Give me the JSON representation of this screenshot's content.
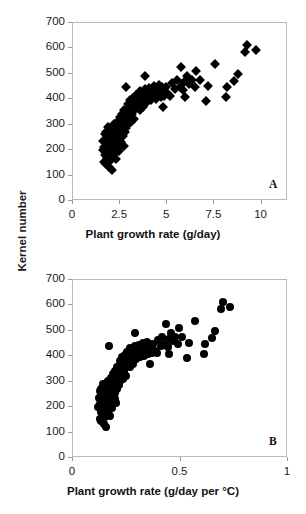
{
  "figure": {
    "ylabel": "Kernel number",
    "panels": [
      {
        "tag": "A",
        "marker": "diamond",
        "xlabel": "Plant growth rate (g/day)"
      },
      {
        "tag": "B",
        "marker": "circle",
        "xlabel": "Plant growth rate (g/day per °C)"
      }
    ]
  },
  "chart_data": [
    {
      "type": "scatter",
      "panel": "A",
      "title": "",
      "xlabel": "Plant growth rate (g/day)",
      "ylabel": "Kernel number",
      "xlim": [
        0,
        11.4
      ],
      "ylim": [
        0,
        700
      ],
      "xticks": [
        0,
        2.5,
        5,
        7.5,
        10
      ],
      "xtick_labels": [
        "0",
        "2.5",
        "5",
        "7.5",
        "10"
      ],
      "yticks": [
        0,
        100,
        200,
        300,
        400,
        500,
        600,
        700
      ],
      "ytick_labels": [
        "0",
        "100",
        "200",
        "300",
        "400",
        "500",
        "600",
        "700"
      ],
      "grid": false,
      "legend": null,
      "marker": "diamond",
      "marker_color": "#000000",
      "annotations": [
        "A"
      ],
      "points": [
        [
          1.62,
          196
        ],
        [
          1.66,
          232
        ],
        [
          1.7,
          150
        ],
        [
          1.72,
          210
        ],
        [
          1.74,
          258
        ],
        [
          1.76,
          178
        ],
        [
          1.78,
          240
        ],
        [
          1.8,
          143
        ],
        [
          1.8,
          226
        ],
        [
          1.82,
          268
        ],
        [
          1.84,
          190
        ],
        [
          1.86,
          252
        ],
        [
          1.88,
          166
        ],
        [
          1.9,
          221
        ],
        [
          1.9,
          288
        ],
        [
          1.92,
          205
        ],
        [
          1.94,
          247
        ],
        [
          1.96,
          130
        ],
        [
          1.98,
          236
        ],
        [
          2.0,
          262
        ],
        [
          2.0,
          181
        ],
        [
          2.02,
          215
        ],
        [
          2.04,
          275
        ],
        [
          2.06,
          158
        ],
        [
          2.08,
          244
        ],
        [
          2.1,
          118
        ],
        [
          2.12,
          228
        ],
        [
          2.14,
          198
        ],
        [
          2.16,
          256
        ],
        [
          2.18,
          172
        ],
        [
          2.2,
          238
        ],
        [
          2.22,
          300
        ],
        [
          2.24,
          212
        ],
        [
          2.26,
          266
        ],
        [
          2.28,
          186
        ],
        [
          2.3,
          248
        ],
        [
          2.32,
          160
        ],
        [
          2.34,
          229
        ],
        [
          2.36,
          282
        ],
        [
          2.38,
          206
        ],
        [
          2.4,
          254
        ],
        [
          2.42,
          310
        ],
        [
          2.44,
          222
        ],
        [
          2.46,
          272
        ],
        [
          2.48,
          194
        ],
        [
          2.5,
          241
        ],
        [
          2.52,
          326
        ],
        [
          2.54,
          213
        ],
        [
          2.56,
          290
        ],
        [
          2.58,
          264
        ],
        [
          2.6,
          302
        ],
        [
          2.62,
          230
        ],
        [
          2.64,
          276
        ],
        [
          2.66,
          340
        ],
        [
          2.68,
          252
        ],
        [
          2.7,
          318
        ],
        [
          2.72,
          288
        ],
        [
          2.74,
          214
        ],
        [
          2.76,
          352
        ],
        [
          2.78,
          306
        ],
        [
          2.8,
          268
        ],
        [
          2.82,
          330
        ],
        [
          2.84,
          296
        ],
        [
          2.86,
          444
        ],
        [
          2.88,
          284
        ],
        [
          2.9,
          346
        ],
        [
          2.92,
          312
        ],
        [
          2.95,
          378
        ],
        [
          2.98,
          300
        ],
        [
          3.0,
          360
        ],
        [
          3.05,
          330
        ],
        [
          3.1,
          392
        ],
        [
          3.12,
          308
        ],
        [
          3.15,
          368
        ],
        [
          3.2,
          340
        ],
        [
          3.25,
          402
        ],
        [
          3.28,
          352
        ],
        [
          3.3,
          318
        ],
        [
          3.35,
          386
        ],
        [
          3.4,
          412
        ],
        [
          3.45,
          362
        ],
        [
          3.5,
          396
        ],
        [
          3.55,
          374
        ],
        [
          3.58,
          430
        ],
        [
          3.6,
          352
        ],
        [
          3.65,
          404
        ],
        [
          3.7,
          380
        ],
        [
          3.75,
          420
        ],
        [
          3.78,
          366
        ],
        [
          3.8,
          396
        ],
        [
          3.85,
          438
        ],
        [
          3.88,
          486
        ],
        [
          3.9,
          410
        ],
        [
          3.95,
          386
        ],
        [
          4.0,
          424
        ],
        [
          4.05,
          398
        ],
        [
          4.1,
          442
        ],
        [
          4.15,
          416
        ],
        [
          4.2,
          392
        ],
        [
          4.25,
          434
        ],
        [
          4.3,
          408
        ],
        [
          4.35,
          448
        ],
        [
          4.4,
          422
        ],
        [
          4.45,
          396
        ],
        [
          4.5,
          440
        ],
        [
          4.55,
          414
        ],
        [
          4.6,
          452
        ],
        [
          4.65,
          428
        ],
        [
          4.7,
          404
        ],
        [
          4.75,
          446
        ],
        [
          4.8,
          366
        ],
        [
          4.85,
          432
        ],
        [
          4.9,
          410
        ],
        [
          5.0,
          444
        ],
        [
          5.1,
          418
        ],
        [
          5.2,
          408
        ],
        [
          5.3,
          462
        ],
        [
          5.45,
          436
        ],
        [
          5.55,
          470
        ],
        [
          5.7,
          446
        ],
        [
          5.8,
          522
        ],
        [
          5.9,
          432
        ],
        [
          5.95,
          466
        ],
        [
          6.0,
          404
        ],
        [
          6.1,
          486
        ],
        [
          6.2,
          456
        ],
        [
          6.35,
          472
        ],
        [
          6.5,
          446
        ],
        [
          6.6,
          506
        ],
        [
          6.8,
          470
        ],
        [
          7.1,
          390
        ],
        [
          7.2,
          448
        ],
        [
          7.6,
          534
        ],
        [
          8.15,
          404
        ],
        [
          8.2,
          446
        ],
        [
          8.6,
          468
        ],
        [
          8.8,
          494
        ],
        [
          9.15,
          582
        ],
        [
          9.3,
          610
        ],
        [
          9.75,
          590
        ]
      ]
    },
    {
      "type": "scatter",
      "panel": "B",
      "title": "",
      "xlabel": "Plant growth rate (g/day per °C)",
      "ylabel": "Kernel number",
      "xlim": [
        0,
        1.0
      ],
      "ylim": [
        0,
        700
      ],
      "xticks": [
        0,
        0.5,
        1
      ],
      "xtick_labels": [
        "0",
        "0.5",
        "1"
      ],
      "yticks": [
        0,
        100,
        200,
        300,
        400,
        500,
        600,
        700
      ],
      "ytick_labels": [
        "0",
        "100",
        "200",
        "300",
        "400",
        "500",
        "600",
        "700"
      ],
      "grid": false,
      "legend": null,
      "marker": "circle",
      "marker_color": "#000000",
      "annotations": [
        "B"
      ],
      "points": [
        [
          0.122,
          196
        ],
        [
          0.125,
          232
        ],
        [
          0.128,
          150
        ],
        [
          0.13,
          210
        ],
        [
          0.131,
          258
        ],
        [
          0.133,
          178
        ],
        [
          0.134,
          240
        ],
        [
          0.136,
          143
        ],
        [
          0.136,
          226
        ],
        [
          0.137,
          268
        ],
        [
          0.139,
          190
        ],
        [
          0.14,
          252
        ],
        [
          0.142,
          166
        ],
        [
          0.143,
          221
        ],
        [
          0.144,
          288
        ],
        [
          0.145,
          205
        ],
        [
          0.146,
          247
        ],
        [
          0.148,
          130
        ],
        [
          0.149,
          236
        ],
        [
          0.151,
          262
        ],
        [
          0.151,
          181
        ],
        [
          0.152,
          215
        ],
        [
          0.154,
          275
        ],
        [
          0.155,
          158
        ],
        [
          0.157,
          244
        ],
        [
          0.158,
          118
        ],
        [
          0.16,
          228
        ],
        [
          0.161,
          198
        ],
        [
          0.163,
          256
        ],
        [
          0.164,
          172
        ],
        [
          0.166,
          238
        ],
        [
          0.167,
          300
        ],
        [
          0.169,
          212
        ],
        [
          0.17,
          266
        ],
        [
          0.172,
          186
        ],
        [
          0.173,
          248
        ],
        [
          0.175,
          160
        ],
        [
          0.176,
          229
        ],
        [
          0.178,
          282
        ],
        [
          0.179,
          206
        ],
        [
          0.181,
          254
        ],
        [
          0.182,
          310
        ],
        [
          0.184,
          222
        ],
        [
          0.186,
          272
        ],
        [
          0.187,
          194
        ],
        [
          0.189,
          241
        ],
        [
          0.19,
          326
        ],
        [
          0.191,
          213
        ],
        [
          0.193,
          290
        ],
        [
          0.194,
          264
        ],
        [
          0.196,
          302
        ],
        [
          0.198,
          230
        ],
        [
          0.199,
          276
        ],
        [
          0.2,
          340
        ],
        [
          0.202,
          252
        ],
        [
          0.204,
          318
        ],
        [
          0.205,
          288
        ],
        [
          0.206,
          214
        ],
        [
          0.208,
          352
        ],
        [
          0.21,
          306
        ],
        [
          0.211,
          268
        ],
        [
          0.213,
          330
        ],
        [
          0.214,
          296
        ],
        [
          0.174,
          438
        ],
        [
          0.217,
          284
        ],
        [
          0.219,
          346
        ],
        [
          0.22,
          312
        ],
        [
          0.222,
          378
        ],
        [
          0.225,
          300
        ],
        [
          0.226,
          360
        ],
        [
          0.23,
          330
        ],
        [
          0.234,
          392
        ],
        [
          0.236,
          308
        ],
        [
          0.238,
          368
        ],
        [
          0.242,
          340
        ],
        [
          0.245,
          402
        ],
        [
          0.248,
          352
        ],
        [
          0.249,
          318
        ],
        [
          0.253,
          386
        ],
        [
          0.257,
          412
        ],
        [
          0.261,
          362
        ],
        [
          0.264,
          396
        ],
        [
          0.268,
          374
        ],
        [
          0.27,
          430
        ],
        [
          0.272,
          352
        ],
        [
          0.276,
          404
        ],
        [
          0.28,
          380
        ],
        [
          0.283,
          420
        ],
        [
          0.285,
          366
        ],
        [
          0.287,
          396
        ],
        [
          0.291,
          438
        ],
        [
          0.293,
          486
        ],
        [
          0.295,
          410
        ],
        [
          0.298,
          386
        ],
        [
          0.302,
          424
        ],
        [
          0.306,
          398
        ],
        [
          0.31,
          442
        ],
        [
          0.314,
          416
        ],
        [
          0.317,
          392
        ],
        [
          0.321,
          434
        ],
        [
          0.325,
          408
        ],
        [
          0.328,
          448
        ],
        [
          0.332,
          422
        ],
        [
          0.336,
          396
        ],
        [
          0.34,
          440
        ],
        [
          0.343,
          414
        ],
        [
          0.347,
          452
        ],
        [
          0.351,
          428
        ],
        [
          0.355,
          404
        ],
        [
          0.358,
          446
        ],
        [
          0.362,
          366
        ],
        [
          0.366,
          432
        ],
        [
          0.37,
          410
        ],
        [
          0.378,
          444
        ],
        [
          0.385,
          418
        ],
        [
          0.393,
          408
        ],
        [
          0.4,
          462
        ],
        [
          0.412,
          436
        ],
        [
          0.419,
          470
        ],
        [
          0.431,
          446
        ],
        [
          0.438,
          522
        ],
        [
          0.446,
          432
        ],
        [
          0.449,
          466
        ],
        [
          0.453,
          404
        ],
        [
          0.461,
          486
        ],
        [
          0.468,
          456
        ],
        [
          0.479,
          472
        ],
        [
          0.491,
          446
        ],
        [
          0.498,
          506
        ],
        [
          0.513,
          470
        ],
        [
          0.536,
          390
        ],
        [
          0.544,
          448
        ],
        [
          0.574,
          534
        ],
        [
          0.616,
          404
        ],
        [
          0.62,
          446
        ],
        [
          0.65,
          468
        ],
        [
          0.665,
          494
        ],
        [
          0.691,
          582
        ],
        [
          0.703,
          610
        ],
        [
          0.737,
          590
        ]
      ]
    }
  ]
}
